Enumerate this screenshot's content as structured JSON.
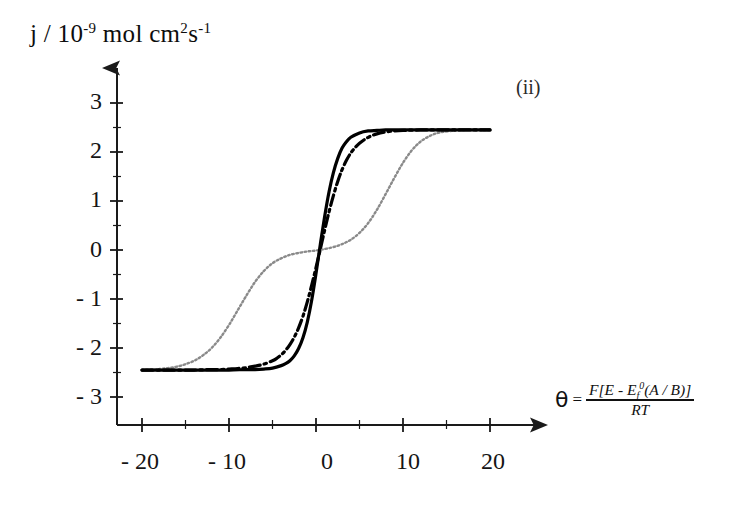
{
  "figure": {
    "panel_letter": "(ii)",
    "y_axis_caption": {
      "prefix": "j / 10",
      "exp1": "-9",
      "mid": " mol cm",
      "exp2": "2",
      "unit": "s",
      "exp3": "-1"
    },
    "x_axis_caption": {
      "symbol": "θ",
      "equals": "=",
      "numerator_pre": "F[E - E",
      "numerator_sub": "f",
      "numerator_sup": "0",
      "numerator_post": "(A / B)]",
      "denominator": "RT"
    }
  },
  "chart_data": {
    "type": "line",
    "title": "",
    "subtitle": "",
    "xlabel": "θ = F[E - E_f^0(A/B)] / RT",
    "ylabel": "j / 10^-9 mol cm^2 s^-1",
    "xlim": [
      -22,
      22
    ],
    "ylim": [
      -3,
      3.4
    ],
    "grid": false,
    "legend": "none",
    "annotations": [
      {
        "text": "(ii)",
        "x": 16,
        "y": 3.0
      }
    ],
    "x_ticks": {
      "major_values": [
        -20,
        -10,
        0,
        10,
        20
      ],
      "major_labels": [
        "- 20",
        "- 10",
        "0",
        "10",
        "20"
      ],
      "minor_values": [
        -15,
        -5,
        5,
        15
      ]
    },
    "y_ticks": {
      "major_values": [
        3,
        2,
        1,
        0,
        -1,
        -2,
        -3
      ],
      "major_labels": [
        "3",
        "2",
        "1",
        "0",
        "- 1",
        "- 2",
        "- 3"
      ],
      "minor_values": [
        2.5,
        1.5,
        0.5,
        -0.5,
        -1.5,
        -2.5
      ]
    },
    "plateau_upper": 2.45,
    "plateau_lower": -2.45,
    "series": [
      {
        "name": "solid-curve",
        "style": "solid",
        "color": "#000000",
        "width": 3.2,
        "description": "Steep single sigmoidal wave centred at theta = 0",
        "x": [
          -20,
          -18,
          -16,
          -14,
          -12,
          -10,
          -8,
          -7,
          -6,
          -5,
          -4,
          -3.5,
          -3,
          -2.5,
          -2,
          -1.5,
          -1,
          -0.5,
          0,
          0.5,
          1,
          1.5,
          2,
          2.5,
          3,
          3.5,
          4,
          5,
          6,
          7,
          8,
          10,
          12,
          14,
          16,
          18,
          20
        ],
        "y": [
          -2.45,
          -2.45,
          -2.45,
          -2.45,
          -2.45,
          -2.45,
          -2.44,
          -2.44,
          -2.43,
          -2.41,
          -2.36,
          -2.32,
          -2.26,
          -2.16,
          -2.01,
          -1.79,
          -1.47,
          -1.03,
          -0.48,
          0.12,
          0.69,
          1.19,
          1.58,
          1.87,
          2.08,
          2.21,
          2.3,
          2.39,
          2.43,
          2.44,
          2.45,
          2.45,
          2.45,
          2.45,
          2.45,
          2.45,
          2.45
        ]
      },
      {
        "name": "dash-dot-curve",
        "style": "dashdot",
        "color": "#000000",
        "width": 3.2,
        "description": "Slightly broader sigmoidal wave, shifted relative to the solid curve",
        "x": [
          -20,
          -18,
          -16,
          -14,
          -12,
          -11,
          -10,
          -9,
          -8,
          -7,
          -6,
          -5,
          -4.5,
          -4,
          -3.5,
          -3,
          -2.5,
          -2,
          -1.5,
          -1,
          -0.5,
          0,
          0.5,
          1,
          1.5,
          2,
          2.5,
          3,
          3.5,
          4,
          4.5,
          5,
          6,
          7,
          8,
          9,
          10,
          12,
          14,
          16,
          18,
          20
        ],
        "y": [
          -2.45,
          -2.45,
          -2.45,
          -2.45,
          -2.44,
          -2.44,
          -2.43,
          -2.42,
          -2.4,
          -2.37,
          -2.33,
          -2.26,
          -2.21,
          -2.14,
          -2.05,
          -1.93,
          -1.78,
          -1.59,
          -1.35,
          -1.06,
          -0.72,
          -0.36,
          0.02,
          0.41,
          0.78,
          1.11,
          1.4,
          1.64,
          1.83,
          1.98,
          2.09,
          2.18,
          2.3,
          2.37,
          2.41,
          2.43,
          2.44,
          2.45,
          2.45,
          2.45,
          2.45,
          2.45
        ]
      },
      {
        "name": "dotted-curve",
        "style": "dotted",
        "color": "#8a8a8a",
        "width": 2.4,
        "description": "Two-step (double) wave: first wave near theta = -7 rising to a plateau at about 0, second wave near theta = +8 rising to 2.45",
        "x": [
          -20,
          -19,
          -18,
          -17,
          -16,
          -15,
          -14,
          -13,
          -12,
          -11,
          -10,
          -9,
          -8,
          -7,
          -6,
          -5,
          -4,
          -3,
          -2,
          -1,
          0,
          1,
          2,
          3,
          4,
          5,
          6,
          7,
          8,
          9,
          10,
          11,
          12,
          13,
          14,
          15,
          16,
          17,
          18,
          19,
          20
        ],
        "y": [
          -2.45,
          -2.44,
          -2.43,
          -2.41,
          -2.38,
          -2.33,
          -2.26,
          -2.15,
          -2.0,
          -1.79,
          -1.53,
          -1.23,
          -0.93,
          -0.65,
          -0.43,
          -0.27,
          -0.17,
          -0.1,
          -0.06,
          -0.03,
          -0.01,
          0.02,
          0.06,
          0.12,
          0.21,
          0.35,
          0.55,
          0.82,
          1.14,
          1.47,
          1.78,
          2.03,
          2.21,
          2.32,
          2.39,
          2.42,
          2.44,
          2.45,
          2.45,
          2.45,
          2.45
        ]
      }
    ]
  },
  "y_tick_labels": [
    {
      "label": "3",
      "top": 88
    },
    {
      "label": "2",
      "top": 137
    },
    {
      "label": "1",
      "top": 186
    },
    {
      "label": "0",
      "top": 236
    },
    {
      "label": "- 1",
      "top": 285
    },
    {
      "label": "- 2",
      "top": 334
    },
    {
      "label": "- 3",
      "top": 383
    }
  ],
  "x_tick_labels": [
    {
      "label": "- 20",
      "left": 112
    },
    {
      "label": "- 10",
      "left": 199
    },
    {
      "label": "0",
      "left": 299
    },
    {
      "label": "10",
      "left": 380
    },
    {
      "label": "20",
      "left": 465
    }
  ]
}
